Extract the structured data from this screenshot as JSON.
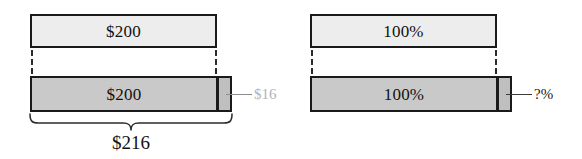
{
  "figure": {
    "panels": [
      {
        "id": "money",
        "base_bar": {
          "label": "$200"
        },
        "total_bar": {
          "label": "$200"
        },
        "extra_segment": {
          "callout": "$16",
          "callout_color": "#b3b3b3"
        },
        "brace": {
          "label": "$216",
          "visible": true
        }
      },
      {
        "id": "percent",
        "base_bar": {
          "label": "100%"
        },
        "total_bar": {
          "label": "100%"
        },
        "extra_segment": {
          "callout": "?%",
          "callout_color": "#1a1a1a"
        },
        "brace": {
          "label": "",
          "visible": false
        }
      }
    ],
    "colors": {
      "base_fill": "#ededed",
      "total_fill": "#c9c9c9",
      "extra_fill": "#bfbfbf",
      "outline": "#1a1a1a",
      "background": "#ffffff"
    }
  }
}
